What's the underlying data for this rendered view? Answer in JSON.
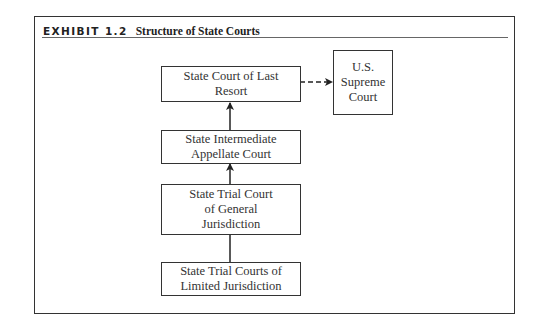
{
  "exhibit": {
    "label": "EXHIBIT 1.2",
    "title": "Structure of State Courts"
  },
  "nodes": {
    "last_resort": "State Court of Last Resort",
    "intermediate": "State Intermediate Appellate Court",
    "general": "State Trial Court of General Jurisdiction",
    "limited": "State Trial Courts of Limited Jurisdiction",
    "supreme": "U.S. Supreme Court"
  },
  "edges": [
    {
      "from": "limited",
      "to": "general",
      "style": "solid"
    },
    {
      "from": "general",
      "to": "intermediate",
      "style": "solid"
    },
    {
      "from": "intermediate",
      "to": "last_resort",
      "style": "solid"
    },
    {
      "from": "last_resort",
      "to": "supreme",
      "style": "dashed"
    }
  ]
}
